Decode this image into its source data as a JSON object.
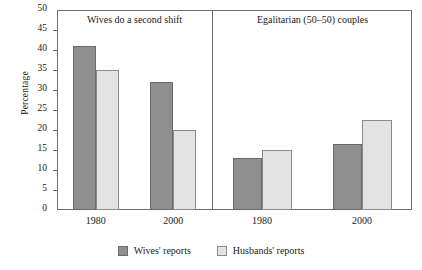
{
  "chart_data": {
    "type": "bar",
    "title": "",
    "xlabel": "",
    "ylabel": "Percentage",
    "ylim": [
      0,
      50
    ],
    "ytick_values": [
      0,
      5,
      10,
      15,
      20,
      25,
      30,
      35,
      40,
      45,
      50
    ],
    "grid": false,
    "legend_position": "bottom",
    "panels": [
      {
        "title": "Wives do a second shift",
        "categories": [
          "1980",
          "2000"
        ],
        "series": [
          {
            "name": "Wives' reports",
            "values": [
              41,
              32
            ]
          },
          {
            "name": "Husbands' reports",
            "values": [
              35,
              20
            ]
          }
        ]
      },
      {
        "title": "Egalitarian (50–50) couples",
        "categories": [
          "1980",
          "2000"
        ],
        "series": [
          {
            "name": "Wives' reports",
            "values": [
              13,
              16.5
            ]
          },
          {
            "name": "Husbands' reports",
            "values": [
              15,
              22.5
            ]
          }
        ]
      }
    ],
    "legend": [
      {
        "label": "Wives' reports",
        "color": "#8f8f8f"
      },
      {
        "label": "Husbands' reports",
        "color": "#e3e3e3"
      }
    ],
    "colors": {
      "wives": "#8f8f8f",
      "husbands": "#e3e3e3",
      "axis": "#6e6e6e",
      "text": "#1a1a1a"
    }
  }
}
